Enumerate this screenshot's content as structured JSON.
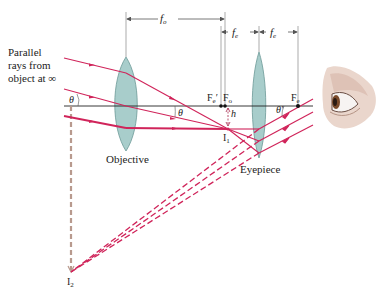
{
  "diagram": {
    "type": "optics-ray-diagram",
    "colors": {
      "ray": "#d0245a",
      "axis": "#222222",
      "lens_fill": "#9fc8c6",
      "lens_stroke": "#5d8f8d",
      "image_dashed": "#b89a8e",
      "dim_line": "#555555"
    },
    "labels": {
      "source_line1": "Parallel",
      "source_line2": "rays from",
      "source_line3": "object at ∞",
      "objective": "Objective",
      "eyepiece": "Eyepiece",
      "f_o": "f",
      "f_o_sub": "o",
      "f_e1": "f",
      "f_e1_sub": "e",
      "f_e2": "f",
      "f_e2_sub": "e",
      "Fe_prime": "F",
      "Fe_prime_sub": "e",
      "Fe_prime_mark": "′",
      "Fo": "F",
      "Fo_sub": "o",
      "Fe": "F",
      "Fe_sub": "e",
      "h": "h",
      "I1": "I",
      "I1_sub": "1",
      "I2": "I",
      "I2_sub": "2",
      "theta_left": "θ",
      "theta_mid": "θ",
      "theta_prime": "θ′"
    },
    "points": {
      "objective_x": 126,
      "eyepiece_x": 259,
      "axis_y": 106,
      "Fo_x": 225,
      "Fe_prime_x": 221,
      "Fe_x": 298,
      "I1": [
        228,
        129
      ],
      "I2": [
        71,
        272
      ]
    }
  }
}
